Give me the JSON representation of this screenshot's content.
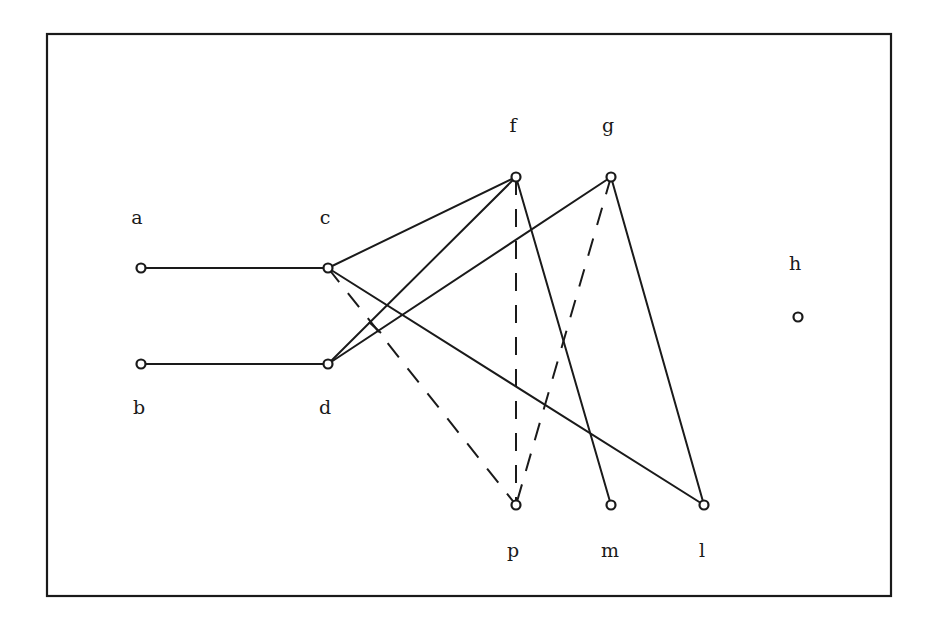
{
  "diagram": {
    "type": "graph",
    "frame": {
      "x": 47,
      "y": 34,
      "width": 844,
      "height": 562
    },
    "nodes": [
      {
        "id": "a",
        "label": "a",
        "x": 141,
        "y": 268,
        "label_x": 137,
        "label_y": 224
      },
      {
        "id": "b",
        "label": "b",
        "x": 141,
        "y": 364,
        "label_x": 139,
        "label_y": 414
      },
      {
        "id": "c",
        "label": "c",
        "x": 328,
        "y": 268,
        "label_x": 325,
        "label_y": 224
      },
      {
        "id": "d",
        "label": "d",
        "x": 328,
        "y": 364,
        "label_x": 325,
        "label_y": 414
      },
      {
        "id": "f",
        "label": "f",
        "x": 516,
        "y": 177,
        "label_x": 513,
        "label_y": 132
      },
      {
        "id": "g",
        "label": "g",
        "x": 611,
        "y": 177,
        "label_x": 608,
        "label_y": 132
      },
      {
        "id": "h",
        "label": "h",
        "x": 798,
        "y": 317,
        "label_x": 795,
        "label_y": 270
      },
      {
        "id": "p",
        "label": "p",
        "x": 516,
        "y": 505,
        "label_x": 513,
        "label_y": 557
      },
      {
        "id": "m",
        "label": "m",
        "x": 611,
        "y": 505,
        "label_x": 610,
        "label_y": 557
      },
      {
        "id": "l",
        "label": "l",
        "x": 704,
        "y": 505,
        "label_x": 702,
        "label_y": 557
      }
    ],
    "edges": [
      {
        "from": "a",
        "to": "c",
        "style": "solid"
      },
      {
        "from": "b",
        "to": "d",
        "style": "solid"
      },
      {
        "from": "c",
        "to": "f",
        "style": "solid"
      },
      {
        "from": "c",
        "to": "l",
        "style": "solid"
      },
      {
        "from": "d",
        "to": "f",
        "style": "solid"
      },
      {
        "from": "d",
        "to": "g",
        "style": "solid"
      },
      {
        "from": "f",
        "to": "m",
        "style": "solid"
      },
      {
        "from": "g",
        "to": "l",
        "style": "solid"
      },
      {
        "from": "c",
        "to": "p",
        "style": "dashed"
      },
      {
        "from": "f",
        "to": "p",
        "style": "dashed"
      },
      {
        "from": "g",
        "to": "p",
        "style": "dashed"
      }
    ],
    "ticks": [
      {
        "x1": 369,
        "y1": 322,
        "x2": 381,
        "y2": 333
      }
    ]
  }
}
